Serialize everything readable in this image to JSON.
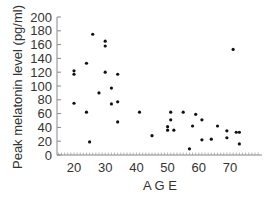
{
  "chart_data": {
    "type": "scatter",
    "title": "",
    "xlabel": "A G E",
    "ylabel": "Peak melatonin level (pg/ml)",
    "xlim": [
      14.5,
      80
    ],
    "ylim": [
      0,
      200
    ],
    "xticks": [
      20,
      30,
      40,
      50,
      60,
      70
    ],
    "yticks": [
      0,
      20,
      40,
      60,
      80,
      100,
      120,
      140,
      160,
      180,
      200
    ],
    "grid": false,
    "legend": null,
    "series": [
      {
        "name": "subjects",
        "points": [
          {
            "x": 20,
            "y": 122
          },
          {
            "x": 20,
            "y": 117
          },
          {
            "x": 20,
            "y": 75
          },
          {
            "x": 24,
            "y": 133
          },
          {
            "x": 24,
            "y": 62
          },
          {
            "x": 25,
            "y": 19
          },
          {
            "x": 26,
            "y": 175
          },
          {
            "x": 28,
            "y": 90
          },
          {
            "x": 30,
            "y": 165
          },
          {
            "x": 30,
            "y": 158
          },
          {
            "x": 30,
            "y": 120
          },
          {
            "x": 32,
            "y": 97
          },
          {
            "x": 32,
            "y": 74
          },
          {
            "x": 34,
            "y": 117
          },
          {
            "x": 34,
            "y": 77
          },
          {
            "x": 34,
            "y": 48
          },
          {
            "x": 41,
            "y": 62
          },
          {
            "x": 45,
            "y": 28
          },
          {
            "x": 50,
            "y": 41
          },
          {
            "x": 50,
            "y": 36
          },
          {
            "x": 51,
            "y": 62
          },
          {
            "x": 51,
            "y": 51
          },
          {
            "x": 52,
            "y": 36
          },
          {
            "x": 55,
            "y": 62
          },
          {
            "x": 57,
            "y": 9
          },
          {
            "x": 58,
            "y": 42
          },
          {
            "x": 59,
            "y": 59
          },
          {
            "x": 61,
            "y": 51
          },
          {
            "x": 61,
            "y": 22
          },
          {
            "x": 64,
            "y": 23
          },
          {
            "x": 66,
            "y": 42
          },
          {
            "x": 69,
            "y": 35
          },
          {
            "x": 69,
            "y": 25
          },
          {
            "x": 71,
            "y": 153
          },
          {
            "x": 72,
            "y": 33
          },
          {
            "x": 73,
            "y": 33
          },
          {
            "x": 73,
            "y": 16
          }
        ]
      }
    ]
  },
  "style": {
    "axis_color": "#888888",
    "point_color": "#111111",
    "text_color": "#333333"
  }
}
